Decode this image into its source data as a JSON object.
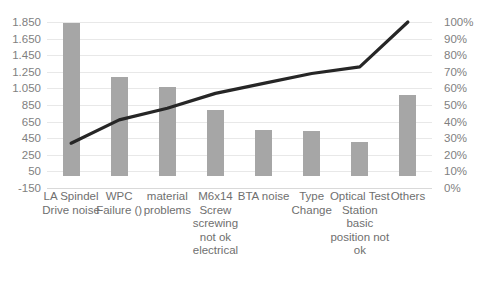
{
  "chart_data": {
    "type": "bar",
    "title": "",
    "subtitle": "",
    "xlabel": "",
    "ylabel": "",
    "categories": [
      "LA Spindel Drive noise",
      "WPC Failure ()",
      "material problems",
      "M6x14 Screw screwing not ok electrical",
      "BTA noise",
      "Type Change",
      "Optical Test Station basic position not ok",
      "Others"
    ],
    "series": [
      {
        "name": "Count",
        "type": "bar",
        "axis": "left",
        "values": [
          1840,
          1190,
          1065,
          785,
          550,
          540,
          405,
          975
        ]
      },
      {
        "name": "Cumulative %",
        "type": "line",
        "axis": "right",
        "values": [
          27,
          41,
          48,
          57,
          63,
          69,
          73,
          100
        ]
      }
    ],
    "ylim": [
      -150,
      1850
    ],
    "y2lim": [
      0,
      100
    ],
    "yticks": [
      "1.850",
      "1.650",
      "1.450",
      "1.250",
      "1.050",
      "850",
      "650",
      "450",
      "250",
      "50",
      "-150"
    ],
    "ytick_values": [
      1850,
      1650,
      1450,
      1250,
      1050,
      850,
      650,
      450,
      250,
      50,
      -150
    ],
    "y2ticks": [
      "100%",
      "90%",
      "80%",
      "70%",
      "60%",
      "50%",
      "40%",
      "30%",
      "20%",
      "10%",
      "0%"
    ],
    "y2tick_values": [
      100,
      90,
      80,
      70,
      60,
      50,
      40,
      30,
      20,
      10,
      0
    ],
    "grid": true,
    "legend": "none",
    "colors": {
      "bar": "#a6a6a6",
      "line": "#262626",
      "grid": "#e8e8e8",
      "tick_text": "#7f7f7f",
      "category_text": "#6f6f6f",
      "background": "#ffffff"
    }
  }
}
